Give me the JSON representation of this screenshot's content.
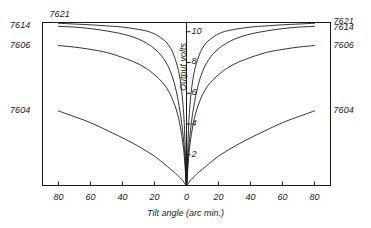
{
  "chart_data": {
    "type": "line",
    "title": "",
    "xlabel": "Tilt angle (arc min.)",
    "ylabel": "Output volts",
    "xticks": [
      80,
      60,
      40,
      20,
      0,
      20,
      40,
      60,
      80
    ],
    "xlim": [
      -90,
      90
    ],
    "yticks": [
      2,
      4,
      6,
      8,
      10
    ],
    "ylim": [
      0,
      10.6
    ],
    "grid": false,
    "legend_position": "inline-end-labels",
    "series": [
      {
        "name": "7621",
        "left_label": "7621",
        "right_label": "7621",
        "left_label_position": "above-top-left",
        "x": [
          -80,
          -70,
          -60,
          -50,
          -40,
          -30,
          -22,
          -16,
          -11,
          -7,
          -4,
          -2,
          -1,
          0,
          1,
          2,
          4,
          7,
          11,
          16,
          22,
          30,
          40,
          50,
          60,
          70,
          80
        ],
        "y": [
          10.55,
          10.5,
          10.45,
          10.38,
          10.3,
          10.15,
          9.95,
          9.6,
          9.1,
          8.2,
          6.9,
          5.0,
          3.0,
          0,
          3.0,
          5.0,
          6.9,
          8.2,
          9.1,
          9.6,
          9.95,
          10.15,
          10.3,
          10.38,
          10.45,
          10.5,
          10.55
        ]
      },
      {
        "name": "7614",
        "left_label": "7614",
        "right_label": "7614",
        "left_label_position": "left-axis",
        "x": [
          -80,
          -70,
          -60,
          -50,
          -40,
          -32,
          -25,
          -19,
          -14,
          -10,
          -7,
          -4.5,
          -2.5,
          -1,
          0,
          1,
          2.5,
          4.5,
          7,
          10,
          14,
          19,
          25,
          32,
          40,
          50,
          60,
          70,
          80
        ],
        "y": [
          10.35,
          10.3,
          10.2,
          10.05,
          9.85,
          9.6,
          9.25,
          8.8,
          8.2,
          7.4,
          6.4,
          5.1,
          3.6,
          1.9,
          0,
          1.9,
          3.6,
          5.1,
          6.4,
          7.4,
          8.2,
          8.8,
          9.25,
          9.6,
          9.85,
          10.05,
          10.2,
          10.3,
          10.35
        ]
      },
      {
        "name": "7606",
        "left_label": "7606",
        "right_label": "7606",
        "left_label_position": "left-axis",
        "x": [
          -80,
          -70,
          -60,
          -52,
          -45,
          -38,
          -31,
          -25,
          -20,
          -15,
          -11,
          -8,
          -5.5,
          -3.5,
          -2,
          -1,
          0,
          1,
          2,
          3.5,
          5.5,
          8,
          11,
          15,
          20,
          25,
          31,
          38,
          45,
          52,
          60,
          70,
          80
        ],
        "y": [
          9.1,
          9.0,
          8.85,
          8.7,
          8.5,
          8.25,
          7.95,
          7.6,
          7.2,
          6.7,
          6.1,
          5.4,
          4.6,
          3.6,
          2.5,
          1.4,
          0,
          1.4,
          2.5,
          3.6,
          4.6,
          5.4,
          6.1,
          6.7,
          7.2,
          7.6,
          7.95,
          8.25,
          8.5,
          8.7,
          8.85,
          9.0,
          9.1
        ]
      },
      {
        "name": "7604",
        "left_label": "7604",
        "right_label": "7604",
        "left_label_position": "left-axis",
        "x": [
          -80,
          -72,
          -64,
          -56,
          -48,
          -40,
          -33,
          -26,
          -20,
          -15,
          -11,
          -7.5,
          -5,
          -3,
          -1.5,
          0,
          1.5,
          3,
          5,
          7.5,
          11,
          15,
          20,
          26,
          33,
          40,
          48,
          56,
          64,
          72,
          80
        ],
        "y": [
          4.85,
          4.55,
          4.25,
          3.9,
          3.5,
          3.1,
          2.72,
          2.3,
          1.9,
          1.5,
          1.15,
          0.85,
          0.6,
          0.4,
          0.2,
          0,
          0.2,
          0.4,
          0.6,
          0.85,
          1.15,
          1.5,
          1.9,
          2.3,
          2.72,
          3.1,
          3.5,
          3.9,
          4.25,
          4.55,
          4.85
        ]
      }
    ]
  },
  "labels": {
    "left": [
      {
        "text": "7621"
      },
      {
        "text": "7614"
      },
      {
        "text": "7606"
      },
      {
        "text": "7604"
      }
    ],
    "right": [
      {
        "text": "7621"
      },
      {
        "text": "7614"
      },
      {
        "text": "7606"
      },
      {
        "text": "7604"
      }
    ]
  },
  "axes": {
    "x_title": "Tilt angle (arc min.)",
    "y_title": "Output volts",
    "x_tick_labels": [
      "80",
      "60",
      "40",
      "20",
      "0",
      "20",
      "40",
      "60",
      "80"
    ],
    "y_tick_labels": [
      "2",
      "4",
      "6",
      "8",
      "10"
    ]
  },
  "style": {
    "line_color": "#1a1a1a",
    "frame_color": "#1a1a1a",
    "background": "#ffffff"
  }
}
